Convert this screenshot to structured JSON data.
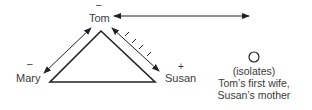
{
  "diagram": {
    "nodes": {
      "tom": {
        "label": "Tom",
        "sign": "–"
      },
      "mary": {
        "label": "Mary",
        "sign": "–"
      },
      "susan": {
        "label": "Susan",
        "sign": "+"
      }
    },
    "isolates": {
      "title": "(isolates)",
      "line1": "Tom’s first wife,",
      "line2": "Susan’s mother"
    },
    "edges": [
      {
        "from": "Tom",
        "to": "Mary",
        "style": "double-arrow"
      },
      {
        "from": "Tom",
        "to": "Susan",
        "style": "double-arrow-hatched"
      },
      {
        "from": "Tom",
        "to": "Tom’s first wife",
        "style": "double-arrow-long"
      }
    ],
    "colors": {
      "line": "#222222",
      "text": "#3a3a3a"
    }
  }
}
